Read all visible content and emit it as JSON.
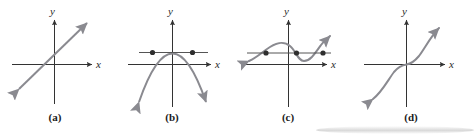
{
  "figure": {
    "width": 474,
    "height": 137,
    "background_color": "#ffffff",
    "axis_color": "#333333",
    "curve_color": "#7a7a80",
    "dot_color": "#3a3a3a",
    "secant_color": "#555555",
    "caption_color": "#1a1a1a"
  },
  "panels": [
    {
      "id": "a",
      "caption": "(a)",
      "x_label": "x",
      "y_label": "y",
      "curve_type": "line",
      "description": "Increasing straight line through origin",
      "intersection_dots": 0,
      "has_horizontal_line": false
    },
    {
      "id": "b",
      "caption": "(b)",
      "x_label": "x",
      "y_label": "y",
      "curve_type": "parabola",
      "description": "Downward opening parabola with vertex above origin",
      "intersection_dots": 2,
      "has_horizontal_line": true
    },
    {
      "id": "c",
      "caption": "(c)",
      "x_label": "x",
      "y_label": "y",
      "curve_type": "cubic-wave",
      "description": "Cubic curve with local maximum and local minimum",
      "intersection_dots": 3,
      "has_horizontal_line": true
    },
    {
      "id": "d",
      "caption": "(d)",
      "x_label": "x",
      "y_label": "y",
      "curve_type": "cubic",
      "description": "Increasing cubic S-curve through the origin",
      "intersection_dots": 0,
      "has_horizontal_line": false
    }
  ]
}
